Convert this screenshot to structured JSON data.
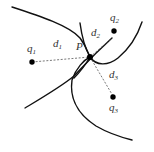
{
  "diagram": {
    "center_point": {
      "label": "P"
    },
    "query_points": [
      {
        "name": "q",
        "sub": "1"
      },
      {
        "name": "q",
        "sub": "2"
      },
      {
        "name": "q",
        "sub": "3"
      }
    ],
    "distances": [
      {
        "name": "d",
        "sub": "1"
      },
      {
        "name": "d",
        "sub": "2"
      },
      {
        "name": "d",
        "sub": "3"
      }
    ],
    "colors": {
      "curve": "#111111",
      "dashed": "#555555",
      "point": "#000000",
      "label": "#333333"
    }
  }
}
